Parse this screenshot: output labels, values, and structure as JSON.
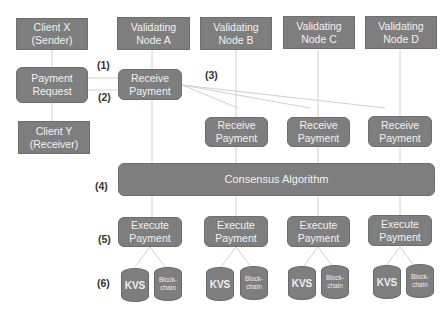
{
  "colors": {
    "box": "#7e7e7e",
    "text": "#f2f2f2",
    "line": "#d0d0d0",
    "label": "#333333"
  },
  "clients": {
    "sender": "Client X\n(Sender)",
    "request": "Payment\nRequest",
    "receiver": "Client Y\n(Receiver)"
  },
  "nodes": [
    {
      "title": "Validating\nNode A",
      "receive": "Receive\nPayment",
      "execute": "Execute\nPayment",
      "kvs": "KVS",
      "blockchain": "Block-\nchain"
    },
    {
      "title": "Validating\nNode B",
      "receive": "Receive\nPayment",
      "execute": "Execute\nPayment",
      "kvs": "KVS",
      "blockchain": "Block-\nchain"
    },
    {
      "title": "Validating\nNode C",
      "receive": "Receive\nPayment",
      "execute": "Execute\nPayment",
      "kvs": "KVS",
      "blockchain": "Block-\nchain"
    },
    {
      "title": "Validating\nNode D",
      "receive": "Receive\nPayment",
      "execute": "Execute\nPayment",
      "kvs": "KVS",
      "blockchain": "Block-\nchain"
    }
  ],
  "consensus": "Consensus Algorithm",
  "steps": [
    "(1)",
    "(2)",
    "(3)",
    "(4)",
    "(5)",
    "(6)"
  ]
}
